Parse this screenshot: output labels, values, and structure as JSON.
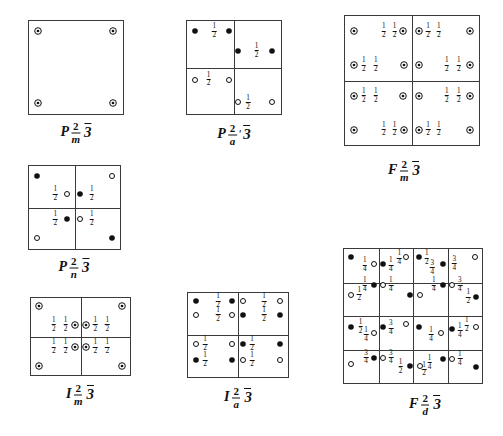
{
  "document": {
    "title": "Cubic space-group symmetry diagrams",
    "description": "Hand-drawn space group diagrams with inversion-centre and rotation-axis symbols"
  },
  "symbols": {
    "filled_dot": "filled-dot",
    "open_circle": "open-circle",
    "dotted_circle": "circle-with-dot"
  },
  "figures": [
    {
      "id": "p2m3",
      "caption": {
        "lattice": "P",
        "num": "2",
        "den": "m",
        "prime": "",
        "axis": "3"
      },
      "box": {
        "x": 28,
        "y": 20,
        "w": 96,
        "h": 95
      },
      "grid": {
        "h": [],
        "v": []
      },
      "marks": [
        {
          "t": "dotted",
          "x": 10,
          "y": 11
        },
        {
          "t": "dotted",
          "x": 89,
          "y": 11
        },
        {
          "t": "dotted",
          "x": 10,
          "y": 88
        },
        {
          "t": "dotted",
          "x": 89,
          "y": 88
        }
      ],
      "fracs": []
    },
    {
      "id": "p2a3",
      "caption": {
        "lattice": "P",
        "num": "2",
        "den": "a",
        "prime": "'",
        "axis": "3"
      },
      "box": {
        "x": 186,
        "y": 20,
        "w": 96,
        "h": 95
      },
      "grid": {
        "h": [
          50
        ],
        "v": [
          50
        ]
      },
      "marks": [
        {
          "t": "filled",
          "x": 9,
          "y": 11
        },
        {
          "t": "filled",
          "x": 45,
          "y": 11
        },
        {
          "t": "filled",
          "x": 54,
          "y": 32
        },
        {
          "t": "filled",
          "x": 90,
          "y": 32
        },
        {
          "t": "open",
          "x": 9,
          "y": 63
        },
        {
          "t": "open",
          "x": 45,
          "y": 63
        },
        {
          "t": "open",
          "x": 54,
          "y": 87
        },
        {
          "t": "open",
          "x": 90,
          "y": 87
        }
      ],
      "fracs": [
        {
          "n": "1",
          "d": "2",
          "x": 29,
          "y": 11
        },
        {
          "n": "1",
          "d": "2",
          "x": 74,
          "y": 32
        },
        {
          "n": "1",
          "d": "2",
          "x": 23,
          "y": 63
        },
        {
          "n": "1",
          "d": "2",
          "x": 65,
          "y": 88
        }
      ]
    },
    {
      "id": "f2m3",
      "caption": {
        "lattice": "F",
        "num": "2",
        "den": "m",
        "prime": "",
        "axis": "3"
      },
      "box": {
        "x": 344,
        "y": 15,
        "w": 136,
        "h": 131
      },
      "grid": {
        "h": [
          50
        ],
        "v": [
          50
        ]
      },
      "marks": [
        {
          "t": "dotted",
          "x": 7,
          "y": 12
        },
        {
          "t": "dotted",
          "x": 43,
          "y": 12
        },
        {
          "t": "dotted",
          "x": 55,
          "y": 12
        },
        {
          "t": "dotted",
          "x": 93,
          "y": 12
        },
        {
          "t": "dotted",
          "x": 7,
          "y": 38
        },
        {
          "t": "dotted",
          "x": 44,
          "y": 38
        },
        {
          "t": "dotted",
          "x": 55,
          "y": 38
        },
        {
          "t": "dotted",
          "x": 93,
          "y": 38
        },
        {
          "t": "dotted",
          "x": 7,
          "y": 62
        },
        {
          "t": "dotted",
          "x": 43,
          "y": 62
        },
        {
          "t": "dotted",
          "x": 55,
          "y": 62
        },
        {
          "t": "dotted",
          "x": 93,
          "y": 62
        },
        {
          "t": "dotted",
          "x": 7,
          "y": 88
        },
        {
          "t": "dotted",
          "x": 44,
          "y": 88
        },
        {
          "t": "dotted",
          "x": 55,
          "y": 88
        },
        {
          "t": "dotted",
          "x": 93,
          "y": 88
        }
      ],
      "fracs": [
        {
          "n": "1",
          "d": "2",
          "x": 29,
          "y": 12
        },
        {
          "n": "1",
          "d": "2",
          "x": 37,
          "y": 12
        },
        {
          "n": "1",
          "d": "2",
          "x": 62,
          "y": 12
        },
        {
          "n": "1",
          "d": "2",
          "x": 70,
          "y": 12
        },
        {
          "n": "1",
          "d": "2",
          "x": 14,
          "y": 38
        },
        {
          "n": "1",
          "d": "2",
          "x": 23,
          "y": 38
        },
        {
          "n": "1",
          "d": "2",
          "x": 76,
          "y": 38
        },
        {
          "n": "1",
          "d": "2",
          "x": 85,
          "y": 38
        },
        {
          "n": "1",
          "d": "2",
          "x": 14,
          "y": 62
        },
        {
          "n": "1",
          "d": "2",
          "x": 23,
          "y": 62
        },
        {
          "n": "1",
          "d": "2",
          "x": 76,
          "y": 62
        },
        {
          "n": "1",
          "d": "2",
          "x": 85,
          "y": 62
        },
        {
          "n": "1",
          "d": "2",
          "x": 29,
          "y": 88
        },
        {
          "n": "1",
          "d": "2",
          "x": 37,
          "y": 88
        },
        {
          "n": "1",
          "d": "2",
          "x": 62,
          "y": 88
        },
        {
          "n": "1",
          "d": "2",
          "x": 70,
          "y": 88
        }
      ]
    },
    {
      "id": "p2n3",
      "caption": {
        "lattice": "P",
        "num": "2",
        "den": "n",
        "prime": "",
        "axis": "3"
      },
      "box": {
        "x": 28,
        "y": 165,
        "w": 93,
        "h": 85
      },
      "grid": {
        "h": [
          50
        ],
        "v": [
          50
        ]
      },
      "marks": [
        {
          "t": "filled",
          "x": 9,
          "y": 12
        },
        {
          "t": "open",
          "x": 91,
          "y": 12
        },
        {
          "t": "open",
          "x": 42,
          "y": 34
        },
        {
          "t": "filled",
          "x": 56,
          "y": 34
        },
        {
          "t": "filled",
          "x": 42,
          "y": 64
        },
        {
          "t": "open",
          "x": 56,
          "y": 64
        },
        {
          "t": "open",
          "x": 9,
          "y": 87
        },
        {
          "t": "filled",
          "x": 91,
          "y": 87
        }
      ],
      "fracs": [
        {
          "n": "1",
          "d": "2",
          "x": 29,
          "y": 34
        },
        {
          "n": "1",
          "d": "2",
          "x": 69,
          "y": 34
        },
        {
          "n": "1",
          "d": "2",
          "x": 29,
          "y": 64
        },
        {
          "n": "1",
          "d": "2",
          "x": 69,
          "y": 64
        }
      ]
    },
    {
      "id": "i2m3",
      "caption": {
        "lattice": "I",
        "num": "2",
        "den": "m",
        "prime": "",
        "axis": "3"
      },
      "box": {
        "x": 30,
        "y": 297,
        "w": 101,
        "h": 79
      },
      "grid": {
        "h": [
          50
        ],
        "v": [
          50
        ]
      },
      "marks": [
        {
          "t": "dotted",
          "x": 8,
          "y": 11
        },
        {
          "t": "dotted",
          "x": 92,
          "y": 11
        },
        {
          "t": "dotted",
          "x": 44,
          "y": 35
        },
        {
          "t": "dotted",
          "x": 56,
          "y": 35
        },
        {
          "t": "dotted",
          "x": 44,
          "y": 64
        },
        {
          "t": "dotted",
          "x": 56,
          "y": 64
        },
        {
          "t": "dotted",
          "x": 8,
          "y": 88
        },
        {
          "t": "dotted",
          "x": 92,
          "y": 88
        }
      ],
      "fracs": [
        {
          "n": "1",
          "d": "2",
          "x": 23,
          "y": 35
        },
        {
          "n": "1",
          "d": "2",
          "x": 35,
          "y": 35
        },
        {
          "n": "1",
          "d": "2",
          "x": 65,
          "y": 35
        },
        {
          "n": "1",
          "d": "2",
          "x": 77,
          "y": 35
        },
        {
          "n": "1",
          "d": "2",
          "x": 23,
          "y": 64
        },
        {
          "n": "1",
          "d": "2",
          "x": 35,
          "y": 64
        },
        {
          "n": "1",
          "d": "2",
          "x": 65,
          "y": 64
        },
        {
          "n": "1",
          "d": "2",
          "x": 77,
          "y": 64
        }
      ]
    },
    {
      "id": "i2a3",
      "caption": {
        "lattice": "I",
        "num": "2",
        "den": "a",
        "prime": "",
        "axis": "3"
      },
      "box": {
        "x": 187,
        "y": 292,
        "w": 102,
        "h": 86
      },
      "grid": {
        "h": [
          50
        ],
        "v": [
          50
        ]
      },
      "marks": [
        {
          "t": "filled",
          "x": 8,
          "y": 10
        },
        {
          "t": "filled",
          "x": 44,
          "y": 10
        },
        {
          "t": "open",
          "x": 55,
          "y": 10
        },
        {
          "t": "open",
          "x": 92,
          "y": 10
        },
        {
          "t": "open",
          "x": 8,
          "y": 26
        },
        {
          "t": "open",
          "x": 44,
          "y": 26
        },
        {
          "t": "filled",
          "x": 55,
          "y": 26
        },
        {
          "t": "filled",
          "x": 92,
          "y": 26
        },
        {
          "t": "open",
          "x": 8,
          "y": 61
        },
        {
          "t": "open",
          "x": 44,
          "y": 61
        },
        {
          "t": "filled",
          "x": 55,
          "y": 61
        },
        {
          "t": "filled",
          "x": 92,
          "y": 61
        },
        {
          "t": "filled",
          "x": 8,
          "y": 80
        },
        {
          "t": "filled",
          "x": 44,
          "y": 80
        },
        {
          "t": "open",
          "x": 55,
          "y": 80
        },
        {
          "t": "open",
          "x": 92,
          "y": 80
        }
      ],
      "fracs": [
        {
          "n": "1",
          "d": "2",
          "x": 30,
          "y": 10
        },
        {
          "n": "1",
          "d": "2",
          "x": 76,
          "y": 10
        },
        {
          "n": "1",
          "d": "2",
          "x": 30,
          "y": 26
        },
        {
          "n": "1",
          "d": "2",
          "x": 76,
          "y": 26
        },
        {
          "n": "1",
          "d": "2",
          "x": 17,
          "y": 61
        },
        {
          "n": "1",
          "d": "2",
          "x": 64,
          "y": 61
        },
        {
          "n": "1",
          "d": "2",
          "x": 17,
          "y": 80
        },
        {
          "n": "1",
          "d": "2",
          "x": 64,
          "y": 80
        }
      ]
    },
    {
      "id": "f2d3",
      "caption": {
        "lattice": "F",
        "num": "2",
        "den": "d",
        "prime": "",
        "axis": "3"
      },
      "box": {
        "x": 343,
        "y": 248,
        "w": 140,
        "h": 136
      },
      "grid": {
        "h": [
          25,
          50,
          75
        ],
        "v": [
          25,
          50,
          75
        ]
      },
      "marks": [
        {
          "t": "filled",
          "x": 5,
          "y": 6
        },
        {
          "t": "open",
          "x": 22,
          "y": 11
        },
        {
          "t": "filled",
          "x": 28,
          "y": 11
        },
        {
          "t": "open",
          "x": 45,
          "y": 6
        },
        {
          "t": "filled",
          "x": 54,
          "y": 6
        },
        {
          "t": "filled",
          "x": 72,
          "y": 11
        },
        {
          "t": "open",
          "x": 95,
          "y": 6
        },
        {
          "t": "filled",
          "x": 22,
          "y": 27
        },
        {
          "t": "open",
          "x": 28,
          "y": 27
        },
        {
          "t": "open",
          "x": 5,
          "y": 34
        },
        {
          "t": "filled",
          "x": 48,
          "y": 34
        },
        {
          "t": "open",
          "x": 55,
          "y": 34
        },
        {
          "t": "filled",
          "x": 72,
          "y": 27
        },
        {
          "t": "open",
          "x": 78,
          "y": 27
        },
        {
          "t": "filled",
          "x": 96,
          "y": 36
        },
        {
          "t": "filled",
          "x": 5,
          "y": 58
        },
        {
          "t": "open",
          "x": 22,
          "y": 63
        },
        {
          "t": "filled",
          "x": 28,
          "y": 58
        },
        {
          "t": "open",
          "x": 45,
          "y": 56
        },
        {
          "t": "filled",
          "x": 54,
          "y": 58
        },
        {
          "t": "open",
          "x": 70,
          "y": 63
        },
        {
          "t": "filled",
          "x": 78,
          "y": 60
        },
        {
          "t": "open",
          "x": 96,
          "y": 58
        },
        {
          "t": "open",
          "x": 5,
          "y": 86
        },
        {
          "t": "filled",
          "x": 22,
          "y": 81
        },
        {
          "t": "open",
          "x": 28,
          "y": 81
        },
        {
          "t": "filled",
          "x": 48,
          "y": 87
        },
        {
          "t": "open",
          "x": 55,
          "y": 87
        },
        {
          "t": "filled",
          "x": 72,
          "y": 82
        },
        {
          "t": "open",
          "x": 78,
          "y": 82
        },
        {
          "t": "filled",
          "x": 96,
          "y": 88
        }
      ],
      "fracs": [
        {
          "n": "1",
          "d": "4",
          "x": 15,
          "y": 12
        },
        {
          "n": "1",
          "d": "4",
          "x": 34,
          "y": 12
        },
        {
          "n": "1",
          "d": "4",
          "x": 40,
          "y": 7
        },
        {
          "n": "1",
          "d": "2",
          "x": 60,
          "y": 7
        },
        {
          "n": "3",
          "d": "4",
          "x": 64,
          "y": 14
        },
        {
          "n": "3",
          "d": "4",
          "x": 80,
          "y": 11
        },
        {
          "n": "1",
          "d": "4",
          "x": 15,
          "y": 27
        },
        {
          "n": "1",
          "d": "4",
          "x": 34,
          "y": 27
        },
        {
          "n": "1",
          "d": "2",
          "x": 11,
          "y": 34
        },
        {
          "n": "1",
          "d": "4",
          "x": 65,
          "y": 27
        },
        {
          "n": "3",
          "d": "4",
          "x": 84,
          "y": 27
        },
        {
          "n": "1",
          "d": "2",
          "x": 90,
          "y": 36
        },
        {
          "n": "1",
          "d": "2",
          "x": 12,
          "y": 58
        },
        {
          "n": "1",
          "d": "4",
          "x": 16,
          "y": 64
        },
        {
          "n": "3",
          "d": "4",
          "x": 34,
          "y": 59
        },
        {
          "n": "1",
          "d": "4",
          "x": 63,
          "y": 64
        },
        {
          "n": "1",
          "d": "4",
          "x": 84,
          "y": 61
        },
        {
          "n": "1",
          "d": "2",
          "x": 89,
          "y": 57
        },
        {
          "n": "3",
          "d": "4",
          "x": 16,
          "y": 81
        },
        {
          "n": "3",
          "d": "4",
          "x": 34,
          "y": 81
        },
        {
          "n": "1",
          "d": "2",
          "x": 41,
          "y": 88
        },
        {
          "n": "1",
          "d": "4",
          "x": 62,
          "y": 85
        },
        {
          "n": "1",
          "d": "2",
          "x": 58,
          "y": 90
        },
        {
          "n": "1",
          "d": "4",
          "x": 84,
          "y": 82
        }
      ]
    }
  ],
  "captions": [
    {
      "x": 76,
      "y": 120
    },
    {
      "x": 234,
      "y": 122
    },
    {
      "x": 404,
      "y": 158
    },
    {
      "x": 74,
      "y": 255
    },
    {
      "x": 80,
      "y": 382
    },
    {
      "x": 238,
      "y": 385
    },
    {
      "x": 425,
      "y": 392
    }
  ]
}
